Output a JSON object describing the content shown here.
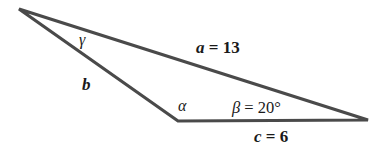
{
  "diagram": {
    "type": "triangle",
    "vertices": {
      "top_left": [
        19,
        9
      ],
      "bottom": [
        178,
        121
      ],
      "right": [
        368,
        120
      ]
    },
    "stroke_color": "#4a4a4a",
    "labels": {
      "gamma": "γ",
      "b": "b",
      "alpha": "α",
      "a_var": "a",
      "a_eq": " = 13",
      "beta_var": "β",
      "beta_eq": " = 20°",
      "c_var": "c",
      "c_eq": " = 6"
    }
  }
}
